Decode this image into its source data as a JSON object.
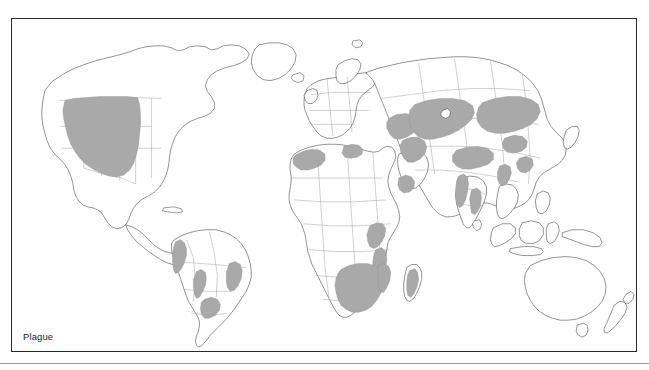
{
  "figure": {
    "caption": "Plague",
    "frame_color": "#2a2a2a",
    "background_color": "#ffffff"
  },
  "legend": {
    "endemic_color": "#a9a9a9",
    "non_endemic_color": "#ffffff",
    "coastline_color": "#3a3a3a",
    "country_border_color": "#8a8a8a"
  },
  "map": {
    "title": "Plague",
    "projection": "world-equirectangular",
    "shaded_meaning": "plague endemic / natural focus areas",
    "regions_shaded": [
      {
        "name": "Western United States",
        "continent": "North America"
      },
      {
        "name": "Andes (Peru, Ecuador, Bolivia)",
        "continent": "South America"
      },
      {
        "name": "Northeast Brazil",
        "continent": "South America"
      },
      {
        "name": "Central Brazil / Bolivia lowlands",
        "continent": "South America"
      },
      {
        "name": "Northwest Africa (Morocco, Algeria, Libya)",
        "continent": "Africa"
      },
      {
        "name": "East Africa (Uganda, Kenya, Tanzania)",
        "continent": "Africa"
      },
      {
        "name": "Southern Africa (Namibia, Botswana, Zimbabwe, Zambia, Mozambique)",
        "continent": "Africa"
      },
      {
        "name": "Madagascar",
        "continent": "Africa"
      },
      {
        "name": "Arabian Peninsula margin / Yemen",
        "continent": "Asia"
      },
      {
        "name": "Caspian Basin, Iran, Caucasus",
        "continent": "Asia"
      },
      {
        "name": "Kazakhstan and Central Asia",
        "continent": "Asia"
      },
      {
        "name": "Mongolia and Northern China",
        "continent": "Asia"
      },
      {
        "name": "Tibetan Plateau / Himalaya",
        "continent": "Asia"
      },
      {
        "name": "India (western and southern foci)",
        "continent": "Asia"
      },
      {
        "name": "Southeast Asia (Myanmar, Vietnam)",
        "continent": "Asia"
      }
    ],
    "regions_unshaded": [
      "Europe",
      "Australia",
      "New Zealand",
      "Greenland",
      "Canada",
      "Eastern United States",
      "Japan"
    ]
  }
}
